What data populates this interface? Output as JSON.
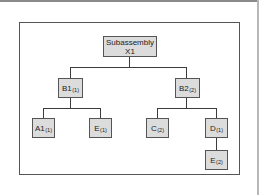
{
  "diagram": {
    "type": "product structure tree",
    "root": {
      "label_line1": "Subassembly",
      "label_line2": "X1"
    },
    "level1": [
      {
        "id": "B1",
        "label": "B1",
        "qty": "(1)"
      },
      {
        "id": "B2",
        "label": "B2",
        "qty": "(2)"
      }
    ],
    "level2": [
      {
        "id": "A1",
        "parent": "B1",
        "label": "A1",
        "qty": "(1)"
      },
      {
        "id": "E1",
        "parent": "B1",
        "label": "E",
        "qty": "(1)"
      },
      {
        "id": "C",
        "parent": "B2",
        "label": "C",
        "qty": "(2)"
      },
      {
        "id": "D",
        "parent": "B2",
        "label": "D",
        "qty": "(1)"
      }
    ],
    "level3": [
      {
        "id": "E2",
        "parent": "D",
        "label": "E",
        "qty": "(2)"
      }
    ],
    "colors": {
      "node_fill": "#dcdcdc",
      "node_border": "#555555",
      "line": "#3c3c3c",
      "frame_border": "#555555",
      "background": "#ffffff"
    }
  }
}
